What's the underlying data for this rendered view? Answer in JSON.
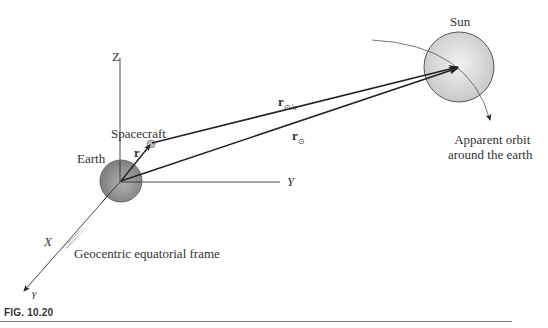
{
  "figure": {
    "caption": "FIG. 10.20",
    "labels": {
      "sun": "Sun",
      "earth": "Earth",
      "spacecraft": "Spacecraft",
      "r": "r",
      "r_sun_rel": "r",
      "r_sun_rel_sub": "⊙/s",
      "r_sun": "r",
      "r_sun_sub": "⊙",
      "axis_z": "Z",
      "axis_y": "Y",
      "axis_x": "X",
      "gamma": "γ",
      "orbit_line1": "Apparent orbit",
      "orbit_line2": "around the earth",
      "frame": "Geocentric equatorial frame"
    },
    "colors": {
      "sun_fill": "#d6d6d6",
      "earth_fill": "#9a9a9a",
      "line": "#222222"
    }
  }
}
